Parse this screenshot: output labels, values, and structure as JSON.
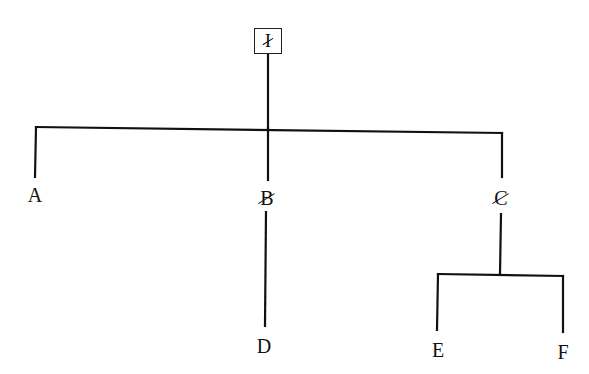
{
  "diagram": {
    "type": "tree",
    "root": {
      "id": "I",
      "label": "I",
      "struck_through": true,
      "boxed": true
    },
    "nodes": [
      {
        "id": "A",
        "label": "A",
        "parent": "I",
        "struck_through": false
      },
      {
        "id": "B",
        "label": "B",
        "parent": "I",
        "struck_through": true
      },
      {
        "id": "C",
        "label": "C",
        "parent": "I",
        "struck_through": true
      },
      {
        "id": "D",
        "label": "D",
        "parent": "B",
        "struck_through": false
      },
      {
        "id": "E",
        "label": "E",
        "parent": "C",
        "struck_through": false
      },
      {
        "id": "F",
        "label": "F",
        "parent": "C",
        "struck_through": false
      }
    ],
    "colors": {
      "line": "#111111",
      "background": "#ffffff"
    }
  }
}
